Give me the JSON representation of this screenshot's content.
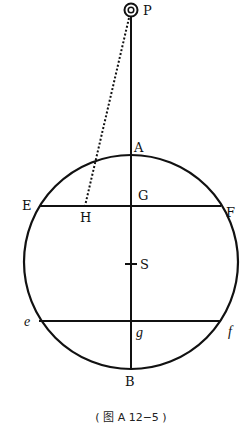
{
  "diagram": {
    "labels": {
      "P": "P",
      "A": "A",
      "E": "E",
      "H": "H",
      "G": "G",
      "F": "F",
      "S": "S",
      "e": "e",
      "g": "g",
      "f": "f",
      "B": "B"
    },
    "caption": "( 图 A 12−5 )",
    "colors": {
      "stroke": "#111111",
      "background": "#ffffff"
    }
  }
}
